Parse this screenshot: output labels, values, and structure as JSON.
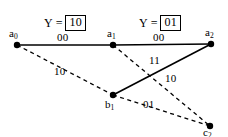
{
  "figure": {
    "type": "trellis-diagram",
    "background_color": "#ffffff",
    "stroke_color": "#000000"
  },
  "annotations": [
    {
      "id": "y-stage-1",
      "var": "Y",
      "eq": "=",
      "value": "10",
      "x": 44,
      "y": 15
    },
    {
      "id": "y-stage-2",
      "var": "Y",
      "eq": "=",
      "value": "01",
      "x": 139,
      "y": 15
    }
  ],
  "nodes": [
    {
      "id": "a0",
      "base": "a",
      "sub": "0",
      "x": 17,
      "y": 45,
      "label_x": 9,
      "label_y": 28
    },
    {
      "id": "a1",
      "base": "a",
      "sub": "1",
      "x": 113,
      "y": 45,
      "label_x": 107,
      "label_y": 28
    },
    {
      "id": "a2",
      "base": "a",
      "sub": "2",
      "x": 211,
      "y": 44,
      "label_x": 205,
      "label_y": 27
    },
    {
      "id": "b1",
      "base": "b",
      "sub": "1",
      "x": 113,
      "y": 95,
      "label_x": 105,
      "label_y": 99
    },
    {
      "id": "c2",
      "base": "c",
      "sub": "2",
      "x": 210,
      "y": 126,
      "label_x": 203,
      "label_y": 127
    }
  ],
  "edges": [
    {
      "id": "a0-a1",
      "from": "a0",
      "to": "a1",
      "style": "solid",
      "label": "00",
      "label_x": 57,
      "label_y": 32
    },
    {
      "id": "a1-a2",
      "from": "a1",
      "to": "a2",
      "style": "solid",
      "label": "00",
      "label_x": 153,
      "label_y": 32
    },
    {
      "id": "b1-a2",
      "from": "b1",
      "to": "a2",
      "style": "solid",
      "label": "11",
      "label_x": 149,
      "label_y": 55
    },
    {
      "id": "a0-b1",
      "from": "a0",
      "to": "b1",
      "style": "dashed",
      "label": "10",
      "label_x": 54,
      "label_y": 66
    },
    {
      "id": "a1-c2",
      "from": "a1",
      "to": "c2",
      "style": "dashed",
      "label": "10",
      "label_x": 165,
      "label_y": 73
    },
    {
      "id": "b1-c2",
      "from": "b1",
      "to": "c2",
      "style": "dashed",
      "label": "01",
      "label_x": 143,
      "label_y": 99
    }
  ]
}
